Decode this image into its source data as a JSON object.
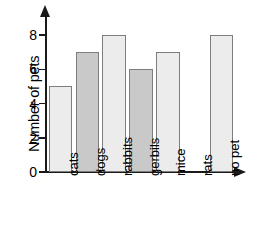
{
  "chart_data": {
    "type": "bar",
    "title": "",
    "xlabel": "",
    "ylabel": "Number of pets",
    "categories": [
      "cats",
      "dogs",
      "rabbits",
      "gerbils",
      "mice",
      "rats",
      "no pet"
    ],
    "values": [
      5,
      7,
      8,
      6,
      7,
      0,
      8
    ],
    "ylim": [
      0,
      9
    ],
    "yticks": [
      0,
      2,
      4,
      6,
      8
    ],
    "ytick_labels": [
      "0",
      "2",
      "4",
      "6",
      "8"
    ],
    "grid": false,
    "legend": null,
    "bar_colors": [
      "#ececec",
      "#c9c9c9",
      "#ececec",
      "#c9c9c9",
      "#ececec",
      "#ececec",
      "#ececec"
    ],
    "bar_edge_color": "#7d7d7d",
    "axis_color": "#1a1a1a",
    "background": "#ffffff"
  }
}
